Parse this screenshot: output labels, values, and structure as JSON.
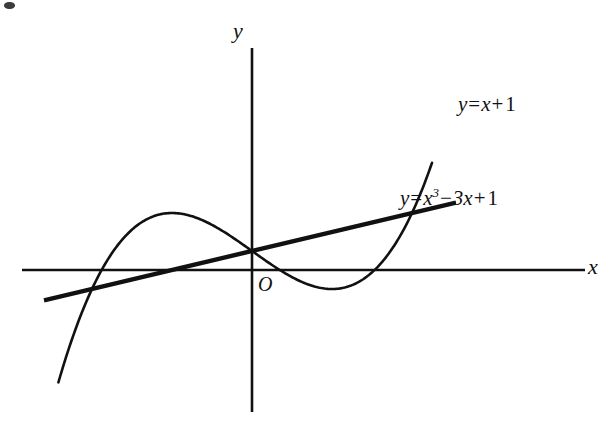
{
  "figure": {
    "origin_label": "O",
    "x_axis_label": "x",
    "y_axis_label": "y",
    "background_color": "#ffffff",
    "ink_color": "#111111"
  },
  "labels": {
    "line": {
      "lhs": "y",
      "equals": "=",
      "var": "x",
      "plus": "+",
      "constant": "1"
    },
    "cubic": {
      "lhs": "y",
      "equals": "=",
      "var": "x",
      "power": "3",
      "minus": "−",
      "linear_term": "3x",
      "plus": "+",
      "constant": "1"
    }
  },
  "chart_data": {
    "type": "line",
    "title": "",
    "xlabel": "x",
    "ylabel": "y",
    "grid": false,
    "legend": "inline-curve-labels",
    "axis_origin_label": "O",
    "xlim": [
      -2.6,
      2.3
    ],
    "ylim": [
      -4.0,
      8.5
    ],
    "axes": {
      "x_axis_pixels": {
        "x1": 22,
        "y1": 270,
        "x2": 585,
        "y2": 270
      },
      "y_axis_pixels": {
        "x1": 252,
        "y1": 48,
        "x2": 252,
        "y2": 412
      },
      "origin_pixels": {
        "x": 252,
        "y": 270
      },
      "pixels_per_x_unit": 80,
      "pixels_per_y_unit": 19
    },
    "series": [
      {
        "name": "y = x^3 - 3x + 1",
        "equation": "y = x³ − 3x + 1",
        "type": "cubic",
        "coefficients": {
          "a": 1,
          "b": 0,
          "c": -3,
          "d": 1
        },
        "x_domain": [
          -2.42,
          2.25
        ],
        "roots": [
          -1.879,
          0.347,
          1.532
        ],
        "local_maximum": {
          "x": -1,
          "y": 3
        },
        "local_minimum": {
          "x": 1,
          "y": -1
        },
        "y_intercept": 1,
        "x": [
          -2.42,
          -2.2,
          -2.0,
          -1.879,
          -1.7,
          -1.5,
          -1.3,
          -1.0,
          -0.7,
          -0.4,
          -0.1,
          0.2,
          0.347,
          0.6,
          0.9,
          1.0,
          1.2,
          1.4,
          1.532,
          1.7,
          1.9,
          2.1,
          2.25
        ],
        "y": [
          -5.92,
          -3.05,
          -1.0,
          0.0,
          1.19,
          2.13,
          2.7,
          3.0,
          2.76,
          2.14,
          1.3,
          0.41,
          0.0,
          -0.58,
          -0.97,
          -1.0,
          -0.87,
          -0.46,
          0.0,
          0.81,
          2.16,
          3.96,
          5.64
        ],
        "stroke_width": 2.6,
        "color": "#111111"
      },
      {
        "name": "y = x + 1",
        "equation": "y = x + 1",
        "type": "linear",
        "slope": 1,
        "intercept": 1,
        "x_domain": [
          -2.6,
          2.55
        ],
        "x_intercept": -1,
        "y_intercept": 1,
        "stroke_width": 4.4,
        "color": "#111111"
      }
    ],
    "intersections": [
      {
        "x": -1.0,
        "y": 0.0,
        "pixels": {
          "x": 218,
          "y": 270
        }
      },
      {
        "x": 0.0,
        "y": 1.0,
        "pixels": {
          "x": 252,
          "y": 248
        }
      },
      {
        "x": 2.0,
        "y": 3.0,
        "pixels": {
          "x": 410,
          "y": 142
        }
      }
    ],
    "annotations": [
      {
        "text": "y = x + 1",
        "pixels": {
          "x": 458,
          "y": 94
        }
      },
      {
        "text": "y = x³ − 3x + 1",
        "pixels": {
          "x": 400,
          "y": 188
        }
      },
      {
        "text": "O",
        "pixels": {
          "x": 258,
          "y": 274
        }
      }
    ]
  }
}
